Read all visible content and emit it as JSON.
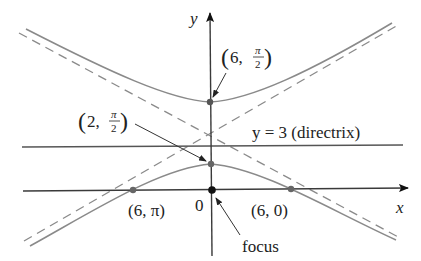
{
  "figure": {
    "type": "polar conic (hyperbola) diagram",
    "axes": {
      "x_label": "x",
      "y_label": "y",
      "origin_label": "0"
    },
    "directrix": {
      "label": "y = 3 (directrix)",
      "equation": "y = 3"
    },
    "points": [
      {
        "id": "upper-vertex",
        "label_main": "6,",
        "label_num": "π",
        "label_den": "2",
        "polar": "(6, π/2)"
      },
      {
        "id": "lower-vertex",
        "label_main": "2,",
        "label_num": "π",
        "label_den": "2",
        "polar": "(2, π/2)"
      },
      {
        "id": "left-intercept",
        "label": "(6, π)"
      },
      {
        "id": "right-intercept",
        "label": "(6, 0)"
      },
      {
        "id": "focus",
        "label": "focus"
      }
    ],
    "colors": {
      "curve": "#8a8a8a",
      "axis": "#3a3a3a",
      "dashed_asymptote": "#8a8a8a",
      "point": "#555555",
      "focus_point": "#111111",
      "text": "#222222"
    }
  }
}
